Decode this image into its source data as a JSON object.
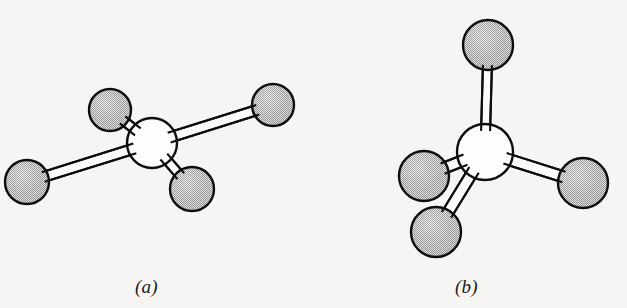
{
  "figure": {
    "background_color": "#f6f5f3",
    "outline_color": "#0d0d0d",
    "sphere_fill_color": "#c8c8c8",
    "sphere_fill_dot_color": "#6e6e6e",
    "central_sphere_fill_color": "#fdfdfb",
    "bond_fill_color": "#fbfbf9"
  },
  "panels": [
    {
      "id": "panel-a",
      "caption": "(a)",
      "caption_x": 135,
      "caption_y": 277,
      "central_atom": {
        "name": "central-atom-a",
        "cx": 152,
        "cy": 143,
        "r": 25,
        "shaded": false
      },
      "ligand_atoms": [
        {
          "name": "ligand-atom-a-upper-left",
          "cx": 110,
          "cy": 110,
          "r": 21,
          "shaded": true
        },
        {
          "name": "ligand-atom-a-right",
          "cx": 273,
          "cy": 105,
          "r": 21,
          "shaded": true
        },
        {
          "name": "ligand-atom-a-left",
          "cx": 27,
          "cy": 182,
          "r": 22,
          "shaded": true
        },
        {
          "name": "ligand-atom-a-bottom",
          "cx": 192,
          "cy": 189,
          "r": 22,
          "shaded": true
        }
      ],
      "bonds": [
        {
          "name": "bond-a-upper-left",
          "x1": 152,
          "y1": 143,
          "x2": 110,
          "y2": 110,
          "width": 9
        },
        {
          "name": "bond-a-right",
          "x1": 152,
          "y1": 143,
          "x2": 273,
          "y2": 105,
          "width": 10
        },
        {
          "name": "bond-a-left",
          "x1": 152,
          "y1": 143,
          "x2": 27,
          "y2": 182,
          "width": 10
        },
        {
          "name": "bond-a-bottom",
          "x1": 152,
          "y1": 143,
          "x2": 192,
          "y2": 189,
          "width": 9
        }
      ]
    },
    {
      "id": "panel-b",
      "caption": "(b)",
      "caption_x": 455,
      "caption_y": 277,
      "central_atom": {
        "name": "central-atom-b",
        "cx": 485,
        "cy": 152,
        "r": 28,
        "shaded": false
      },
      "ligand_atoms": [
        {
          "name": "ligand-atom-b-top",
          "cx": 488,
          "cy": 45,
          "r": 25,
          "shaded": true
        },
        {
          "name": "ligand-atom-b-left",
          "cx": 424,
          "cy": 176,
          "r": 25,
          "shaded": true
        },
        {
          "name": "ligand-atom-b-bottom-left",
          "cx": 436,
          "cy": 232,
          "r": 25,
          "shaded": true
        },
        {
          "name": "ligand-atom-b-right",
          "cx": 583,
          "cy": 183,
          "r": 25,
          "shaded": true
        }
      ],
      "bonds": [
        {
          "name": "bond-b-top",
          "x1": 485,
          "y1": 152,
          "x2": 488,
          "y2": 45,
          "width": 9
        },
        {
          "name": "bond-b-left",
          "x1": 485,
          "y1": 152,
          "x2": 424,
          "y2": 176,
          "width": 11
        },
        {
          "name": "bond-b-bottom-left",
          "x1": 485,
          "y1": 152,
          "x2": 436,
          "y2": 232,
          "width": 11
        },
        {
          "name": "bond-b-right",
          "x1": 485,
          "y1": 152,
          "x2": 583,
          "y2": 183,
          "width": 11
        }
      ]
    }
  ]
}
